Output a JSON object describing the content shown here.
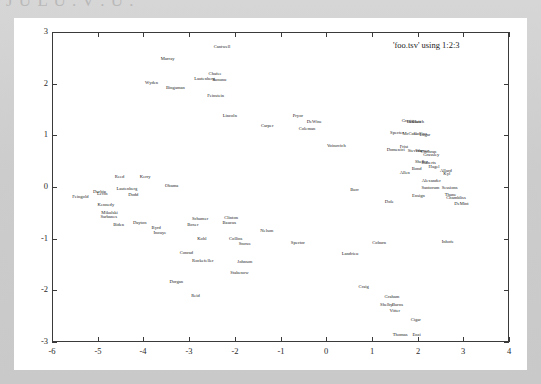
{
  "window": {
    "top_cut_text": "J U L U .  V .  U .",
    "background_color": "#cfcfcf",
    "card_color": "#ffffff"
  },
  "chart_data": {
    "type": "scatter",
    "title": "",
    "legend": "'foo.tsv' using 1:2:3",
    "legend_position": "top-right-inside",
    "xlabel": "",
    "ylabel": "",
    "xlim": [
      -6,
      4
    ],
    "ylim": [
      -3,
      3
    ],
    "xticks": [
      -6,
      -5,
      -4,
      -3,
      -2,
      -1,
      0,
      1,
      2,
      3,
      4
    ],
    "yticks": [
      -3,
      -2,
      -1,
      0,
      1,
      2,
      3
    ],
    "grid": false,
    "point_style": "text-labels",
    "label_color": "#222222",
    "points": [
      {
        "label": "Cantwell",
        "x": -2.28,
        "y": 2.72
      },
      {
        "label": "Murray",
        "x": -3.47,
        "y": 2.48
      },
      {
        "label": "Chafee",
        "x": -2.43,
        "y": 2.18
      },
      {
        "label": "Lautenberg",
        "x": -2.66,
        "y": 2.1
      },
      {
        "label": "Sununu",
        "x": -2.34,
        "y": 2.08
      },
      {
        "label": "Wyden",
        "x": -3.82,
        "y": 2.02
      },
      {
        "label": "Bingaman",
        "x": -3.3,
        "y": 1.92
      },
      {
        "label": "Feinstein",
        "x": -2.42,
        "y": 1.76
      },
      {
        "label": "Lincoln",
        "x": -2.11,
        "y": 1.37
      },
      {
        "label": "Pryor",
        "x": -0.62,
        "y": 1.38
      },
      {
        "label": "Carper",
        "x": -1.29,
        "y": 1.18
      },
      {
        "label": "DeWine",
        "x": -0.26,
        "y": 1.25
      },
      {
        "label": "Coleman",
        "x": -0.42,
        "y": 1.12
      },
      {
        "label": "Gregg",
        "x": 1.78,
        "y": 1.27
      },
      {
        "label": "Bennett",
        "x": 1.92,
        "y": 1.26
      },
      {
        "label": "Hatch",
        "x": 2.02,
        "y": 1.25
      },
      {
        "label": "Specter",
        "x": 1.55,
        "y": 1.05
      },
      {
        "label": "McCain",
        "x": 1.83,
        "y": 1.03
      },
      {
        "label": "Collins",
        "x": 2.06,
        "y": 1.02
      },
      {
        "label": "Lugar",
        "x": 2.16,
        "y": 1.01
      },
      {
        "label": "Voinovich",
        "x": 0.22,
        "y": 0.8
      },
      {
        "label": "Frist",
        "x": 1.7,
        "y": 0.77
      },
      {
        "label": "Domenici",
        "x": 1.52,
        "y": 0.72
      },
      {
        "label": "Stevens",
        "x": 1.94,
        "y": 0.7
      },
      {
        "label": "Warner",
        "x": 2.1,
        "y": 0.69
      },
      {
        "label": "Cochran",
        "x": 2.24,
        "y": 0.68
      },
      {
        "label": "Grassley",
        "x": 2.3,
        "y": 0.62
      },
      {
        "label": "Shelby",
        "x": 2.08,
        "y": 0.48
      },
      {
        "label": "Roberts",
        "x": 2.24,
        "y": 0.47
      },
      {
        "label": "Bond",
        "x": 1.98,
        "y": 0.35
      },
      {
        "label": "Hagel",
        "x": 2.36,
        "y": 0.38
      },
      {
        "label": "Allard",
        "x": 2.62,
        "y": 0.32
      },
      {
        "label": "Kyl",
        "x": 2.64,
        "y": 0.26
      },
      {
        "label": "Allen",
        "x": 1.72,
        "y": 0.28
      },
      {
        "label": "Alexander",
        "x": 2.3,
        "y": 0.12
      },
      {
        "label": "Santorum",
        "x": 2.28,
        "y": -0.01
      },
      {
        "label": "Sessions",
        "x": 2.7,
        "y": -0.02
      },
      {
        "label": "Ensign",
        "x": 2.02,
        "y": -0.17
      },
      {
        "label": "Thune",
        "x": 2.72,
        "y": -0.16
      },
      {
        "label": "Chambliss",
        "x": 2.84,
        "y": -0.22
      },
      {
        "label": "DeMint",
        "x": 2.96,
        "y": -0.32
      },
      {
        "label": "Reed",
        "x": -4.52,
        "y": 0.2
      },
      {
        "label": "Kerry",
        "x": -3.96,
        "y": 0.2
      },
      {
        "label": "Obama",
        "x": -3.38,
        "y": 0.02
      },
      {
        "label": "Lautenberg",
        "x": -4.36,
        "y": -0.04
      },
      {
        "label": "Durbin",
        "x": -4.96,
        "y": -0.1
      },
      {
        "label": "Levin",
        "x": -4.9,
        "y": -0.14
      },
      {
        "label": "Dodd",
        "x": -4.22,
        "y": -0.16
      },
      {
        "label": "Feingold",
        "x": -5.38,
        "y": -0.2
      },
      {
        "label": "Kennedy",
        "x": -4.82,
        "y": -0.34
      },
      {
        "label": "Mikulski",
        "x": -4.74,
        "y": -0.5
      },
      {
        "label": "Sarbanes",
        "x": -4.76,
        "y": -0.58
      },
      {
        "label": "Biden",
        "x": -4.54,
        "y": -0.74
      },
      {
        "label": "Dayton",
        "x": -4.08,
        "y": -0.7
      },
      {
        "label": "Burr",
        "x": 0.62,
        "y": -0.06
      },
      {
        "label": "Dole",
        "x": 1.38,
        "y": -0.28
      },
      {
        "label": "Schumer",
        "x": -2.76,
        "y": -0.62
      },
      {
        "label": "Boxer",
        "x": -2.92,
        "y": -0.74
      },
      {
        "label": "Clinton",
        "x": -2.08,
        "y": -0.6
      },
      {
        "label": "Baucus",
        "x": -2.12,
        "y": -0.7
      },
      {
        "label": "Byrd",
        "x": -3.72,
        "y": -0.8
      },
      {
        "label": "Inouye",
        "x": -3.64,
        "y": -0.88
      },
      {
        "label": "Nelson",
        "x": -1.3,
        "y": -0.86
      },
      {
        "label": "Kohl",
        "x": -2.72,
        "y": -1.0
      },
      {
        "label": "Collins",
        "x": -1.98,
        "y": -1.0
      },
      {
        "label": "Snowe",
        "x": -1.78,
        "y": -1.1
      },
      {
        "label": "Spector",
        "x": -0.62,
        "y": -1.08
      },
      {
        "label": "Coburn",
        "x": 1.16,
        "y": -1.08
      },
      {
        "label": "Inhofe",
        "x": 2.66,
        "y": -1.06
      },
      {
        "label": "Conrad",
        "x": -3.06,
        "y": -1.28
      },
      {
        "label": "Landrieu",
        "x": 0.52,
        "y": -1.3
      },
      {
        "label": "Rockefeller",
        "x": -2.7,
        "y": -1.44
      },
      {
        "label": "Johnson",
        "x": -1.78,
        "y": -1.46
      },
      {
        "label": "Stabenow",
        "x": -1.9,
        "y": -1.66
      },
      {
        "label": "Dorgan",
        "x": -3.28,
        "y": -1.84
      },
      {
        "label": "Reid",
        "x": -2.86,
        "y": -2.1
      },
      {
        "label": "Craig",
        "x": 0.82,
        "y": -1.94
      },
      {
        "label": "Graham",
        "x": 1.44,
        "y": -2.12
      },
      {
        "label": "Shelby",
        "x": 1.32,
        "y": -2.28
      },
      {
        "label": "Burns",
        "x": 1.56,
        "y": -2.28
      },
      {
        "label": "Vitter",
        "x": 1.5,
        "y": -2.4
      },
      {
        "label": "Cigar",
        "x": 1.96,
        "y": -2.58
      },
      {
        "label": "Thomas",
        "x": 1.62,
        "y": -2.86
      },
      {
        "label": "Enzi",
        "x": 1.98,
        "y": -2.86
      }
    ]
  }
}
